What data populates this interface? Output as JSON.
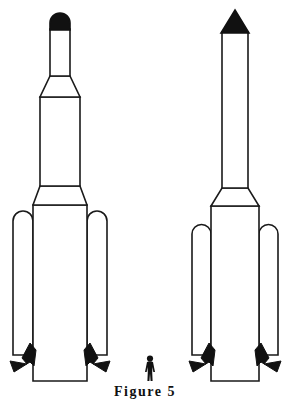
{
  "figure": {
    "caption": "Figure 5",
    "background_color": "#ffffff",
    "line_color": "#1a1a1a",
    "fill_color": "#ffffff",
    "solid_color": "#111111",
    "stroke_width": 1.6
  },
  "diagram": {
    "type": "technical-line-drawing",
    "vehicle_count": 2,
    "scale_reference": "human figure"
  },
  "left_vehicle": {
    "label": "left-launch-vehicle",
    "nose": {
      "shape": "rounded-dome",
      "filled": true,
      "x_left": 50,
      "x_right": 70,
      "y_top": 13,
      "y_base": 29
    },
    "upper_tube": {
      "shape": "narrow-cylinder",
      "x_left": 50,
      "x_right": 70,
      "y_top": 29,
      "y_bottom": 76
    },
    "upper_interstage": {
      "shape": "trapezoid-flare",
      "y_top": 76,
      "y_bottom": 97,
      "top_left": 50,
      "top_right": 70,
      "bottom_left": 40,
      "bottom_right": 80
    },
    "second_stage": {
      "shape": "cylinder",
      "x_left": 40,
      "x_right": 80,
      "y_top": 97,
      "y_bottom": 186
    },
    "lower_interstage": {
      "shape": "trapezoid-flare",
      "y_top": 186,
      "y_bottom": 205,
      "top_left": 40,
      "top_right": 80,
      "bottom_left": 33,
      "bottom_right": 87
    },
    "core_stage": {
      "shape": "cylinder",
      "x_left": 33,
      "x_right": 87,
      "y_top": 205,
      "y_bottom": 381
    },
    "boosters": [
      {
        "side": "left",
        "x_left": 13,
        "x_right": 33,
        "y_top": 211,
        "y_bottom": 355,
        "top_shape": "rounded"
      },
      {
        "side": "right",
        "x_left": 87,
        "x_right": 107,
        "y_top": 211,
        "y_bottom": 355,
        "top_shape": "rounded"
      }
    ],
    "nozzles": [
      {
        "side": "left",
        "shape": "flared-bell",
        "filled": true
      },
      {
        "side": "right",
        "shape": "flared-bell",
        "filled": true
      }
    ]
  },
  "right_vehicle": {
    "label": "right-launch-vehicle",
    "nose": {
      "shape": "sharp-cone",
      "filled": true,
      "x_left": 222,
      "x_right": 248,
      "y_apex": 10,
      "y_base": 32
    },
    "upper_tube": {
      "shape": "narrow-cylinder",
      "x_left": 222,
      "x_right": 248,
      "y_top": 32,
      "y_bottom": 188
    },
    "interstage": {
      "shape": "trapezoid-flare",
      "y_top": 188,
      "y_bottom": 206,
      "top_left": 222,
      "top_right": 248,
      "bottom_left": 211,
      "bottom_right": 259
    },
    "core_stage": {
      "shape": "cylinder",
      "x_left": 211,
      "x_right": 259,
      "y_top": 206,
      "y_bottom": 381
    },
    "boosters": [
      {
        "side": "left",
        "x_left": 192,
        "x_right": 211,
        "y_top": 224,
        "y_bottom": 355,
        "top_shape": "rounded"
      },
      {
        "side": "right",
        "x_left": 259,
        "x_right": 278,
        "y_top": 224,
        "y_bottom": 355,
        "top_shape": "rounded"
      }
    ],
    "nozzles": [
      {
        "side": "left",
        "shape": "flared-bell",
        "filled": true
      },
      {
        "side": "right",
        "shape": "flared-bell",
        "filled": true
      }
    ]
  },
  "human_figure": {
    "label": "scale-human-figure",
    "filled": true,
    "x_center": 150,
    "y_top": 355,
    "y_bottom": 381,
    "height_px": 26
  }
}
